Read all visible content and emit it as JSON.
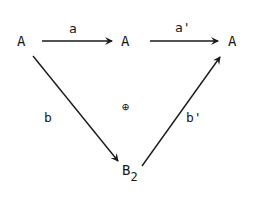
{
  "diagram": {
    "nodes": {
      "left": "A",
      "middle": "A",
      "right": "A",
      "bottom": "B",
      "bottom_subscript": "2"
    },
    "arrows": {
      "top_left": "a",
      "top_right": "a'",
      "diag_down": "b",
      "diag_up": "b'"
    },
    "center_symbol": "⊕",
    "colors": {
      "ink": "#1a1a1a",
      "background": "#ffffff"
    }
  }
}
